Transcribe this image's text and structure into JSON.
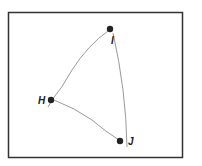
{
  "diagram": {
    "frame": {
      "x": 8,
      "y": 12,
      "width": 175,
      "height": 146,
      "stroke": "#333333"
    },
    "points": [
      {
        "id": "H",
        "label": "H",
        "x": 51,
        "y": 100
      },
      {
        "id": "I",
        "label": "I",
        "x": 110,
        "y": 29
      },
      {
        "id": "J",
        "label": "J",
        "x": 120,
        "y": 141
      }
    ],
    "edges": [
      {
        "from": "H",
        "to": "I"
      },
      {
        "from": "I",
        "to": "J"
      },
      {
        "from": "H",
        "to": "J"
      }
    ],
    "colors": {
      "point": "#222222",
      "line": "#999999",
      "frame": "#333333",
      "background": "#ffffff"
    }
  }
}
